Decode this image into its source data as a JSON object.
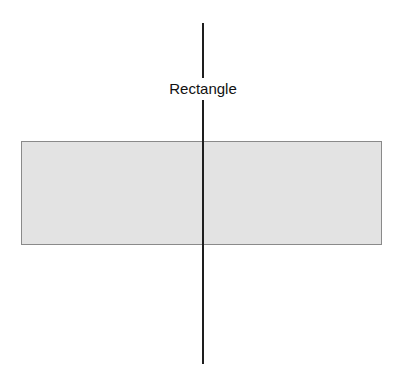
{
  "diagram": {
    "label": "Rectangle",
    "shapes": [
      {
        "type": "rectangle",
        "fill": "#e3e3e3",
        "stroke": "#8a8a8a"
      },
      {
        "type": "vertical-line",
        "stroke": "#1e1e1e"
      }
    ]
  }
}
